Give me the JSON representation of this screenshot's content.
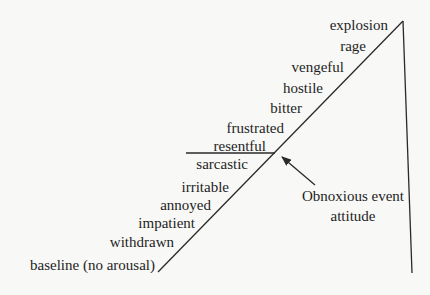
{
  "diagram": {
    "type": "escalation-ramp",
    "ramp_labels": [
      {
        "id": "explosion",
        "text": "explosion"
      },
      {
        "id": "rage",
        "text": "rage"
      },
      {
        "id": "vengeful",
        "text": "vengeful"
      },
      {
        "id": "hostile",
        "text": "hostile"
      },
      {
        "id": "bitter",
        "text": "bitter"
      },
      {
        "id": "frustrated",
        "text": "frustrated"
      },
      {
        "id": "resentful",
        "text": "resentful"
      },
      {
        "id": "sarcastic",
        "text": "sarcastic"
      },
      {
        "id": "irritable",
        "text": "irritable"
      },
      {
        "id": "annoyed",
        "text": "annoyed"
      },
      {
        "id": "impatient",
        "text": "impatient"
      },
      {
        "id": "withdrawn",
        "text": "withdrawn"
      },
      {
        "id": "baseline",
        "text": "baseline (no arousal)"
      }
    ],
    "annotation": {
      "line1": "Obnoxious event",
      "line2": "attitude"
    },
    "colors": {
      "background": "#f8f8f6",
      "line": "#2a2a2a",
      "text": "#1e1e1e"
    }
  }
}
